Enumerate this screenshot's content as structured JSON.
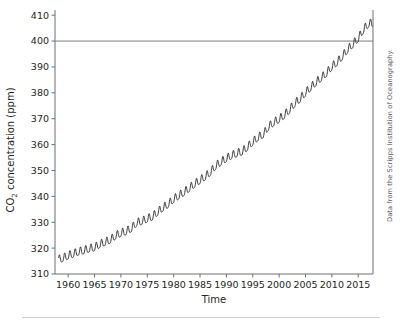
{
  "figure": {
    "credit": "Data from the Scripps Institution of Oceanography."
  },
  "chart_data": {
    "type": "line",
    "title": "",
    "xlabel": "Time",
    "ylabel": "CO2 concentration (ppm)",
    "ylabel_main": "CO",
    "ylabel_sub": "2",
    "ylabel_rest": " concentration (ppm)",
    "xlim": [
      1957.5,
      2017.8
    ],
    "ylim": [
      310,
      412
    ],
    "xticks": [
      1960,
      1965,
      1970,
      1975,
      1980,
      1985,
      1990,
      1995,
      2000,
      2005,
      2010,
      2015
    ],
    "xtick_labels": [
      "1960",
      "1965",
      "1970",
      "1975",
      "1980",
      "1985",
      "1990",
      "1995",
      "2000",
      "2005",
      "2010",
      "2015"
    ],
    "yticks": [
      310,
      320,
      330,
      340,
      350,
      360,
      370,
      380,
      390,
      400,
      410
    ],
    "ytick_labels": [
      "310",
      "320",
      "330",
      "340",
      "350",
      "360",
      "370",
      "380",
      "390",
      "400",
      "410"
    ],
    "grid": false,
    "legend": null,
    "reference_lines": [
      {
        "axis": "y",
        "value": 400,
        "label": "",
        "color": "#6d6e71"
      }
    ],
    "series": [
      {
        "name": "Atmospheric CO2 (Mauna Loa monthly mean)",
        "color": "#1a1a1a",
        "seasonal_amplitude_ppm": 3.0,
        "seasonal_peak_month": 5,
        "annual_means": [
          {
            "year": 1958,
            "value": 315.3
          },
          {
            "year": 1959,
            "value": 315.9
          },
          {
            "year": 1960,
            "value": 316.9
          },
          {
            "year": 1961,
            "value": 317.6
          },
          {
            "year": 1962,
            "value": 318.4
          },
          {
            "year": 1963,
            "value": 318.9
          },
          {
            "year": 1964,
            "value": 319.6
          },
          {
            "year": 1965,
            "value": 320.0
          },
          {
            "year": 1966,
            "value": 321.3
          },
          {
            "year": 1967,
            "value": 322.1
          },
          {
            "year": 1968,
            "value": 323.0
          },
          {
            "year": 1969,
            "value": 324.6
          },
          {
            "year": 1970,
            "value": 325.6
          },
          {
            "year": 1971,
            "value": 326.3
          },
          {
            "year": 1972,
            "value": 327.4
          },
          {
            "year": 1973,
            "value": 329.6
          },
          {
            "year": 1974,
            "value": 330.2
          },
          {
            "year": 1975,
            "value": 331.1
          },
          {
            "year": 1976,
            "value": 332.0
          },
          {
            "year": 1977,
            "value": 333.8
          },
          {
            "year": 1978,
            "value": 335.4
          },
          {
            "year": 1979,
            "value": 336.8
          },
          {
            "year": 1980,
            "value": 338.7
          },
          {
            "year": 1981,
            "value": 340.1
          },
          {
            "year": 1982,
            "value": 341.4
          },
          {
            "year": 1983,
            "value": 343.0
          },
          {
            "year": 1984,
            "value": 344.6
          },
          {
            "year": 1985,
            "value": 346.0
          },
          {
            "year": 1986,
            "value": 347.4
          },
          {
            "year": 1987,
            "value": 349.2
          },
          {
            "year": 1988,
            "value": 351.6
          },
          {
            "year": 1989,
            "value": 353.1
          },
          {
            "year": 1990,
            "value": 354.4
          },
          {
            "year": 1991,
            "value": 355.6
          },
          {
            "year": 1992,
            "value": 356.4
          },
          {
            "year": 1993,
            "value": 357.1
          },
          {
            "year": 1994,
            "value": 358.8
          },
          {
            "year": 1995,
            "value": 360.8
          },
          {
            "year": 1996,
            "value": 362.6
          },
          {
            "year": 1997,
            "value": 363.7
          },
          {
            "year": 1998,
            "value": 366.7
          },
          {
            "year": 1999,
            "value": 368.4
          },
          {
            "year": 2000,
            "value": 369.6
          },
          {
            "year": 2001,
            "value": 371.2
          },
          {
            "year": 2002,
            "value": 373.3
          },
          {
            "year": 2003,
            "value": 375.8
          },
          {
            "year": 2004,
            "value": 377.5
          },
          {
            "year": 2005,
            "value": 379.8
          },
          {
            "year": 2006,
            "value": 381.9
          },
          {
            "year": 2007,
            "value": 383.8
          },
          {
            "year": 2008,
            "value": 385.6
          },
          {
            "year": 2009,
            "value": 387.4
          },
          {
            "year": 2010,
            "value": 389.9
          },
          {
            "year": 2011,
            "value": 391.6
          },
          {
            "year": 2012,
            "value": 393.9
          },
          {
            "year": 2013,
            "value": 396.5
          },
          {
            "year": 2014,
            "value": 398.6
          },
          {
            "year": 2015,
            "value": 400.8
          },
          {
            "year": 2016,
            "value": 404.2
          },
          {
            "year": 2017,
            "value": 406.6
          }
        ]
      }
    ]
  }
}
